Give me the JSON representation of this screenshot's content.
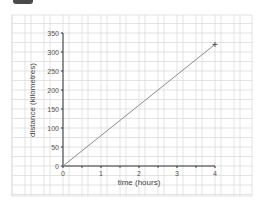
{
  "header": {
    "tab_icon": "dark-tab"
  },
  "colors": {
    "grid": "#dcdcdc",
    "axis": "#333333",
    "line": "#8c8c8c",
    "marker": "#555555",
    "text": "#555555"
  },
  "chart_data": {
    "type": "line",
    "title": "",
    "xlabel": "time (hours)",
    "ylabel": "distance (kilometres)",
    "x_ticks": [
      "0",
      "1",
      "2",
      "3",
      "4"
    ],
    "y_ticks": [
      "0",
      "50",
      "100",
      "150",
      "200",
      "250",
      "300",
      "350"
    ],
    "xlim": [
      0,
      4
    ],
    "ylim": [
      0,
      350
    ],
    "grid": true,
    "legend": null,
    "series": [
      {
        "name": "distance",
        "x": [
          0,
          4
        ],
        "y": [
          0,
          320
        ],
        "end_marker": "+"
      }
    ]
  }
}
